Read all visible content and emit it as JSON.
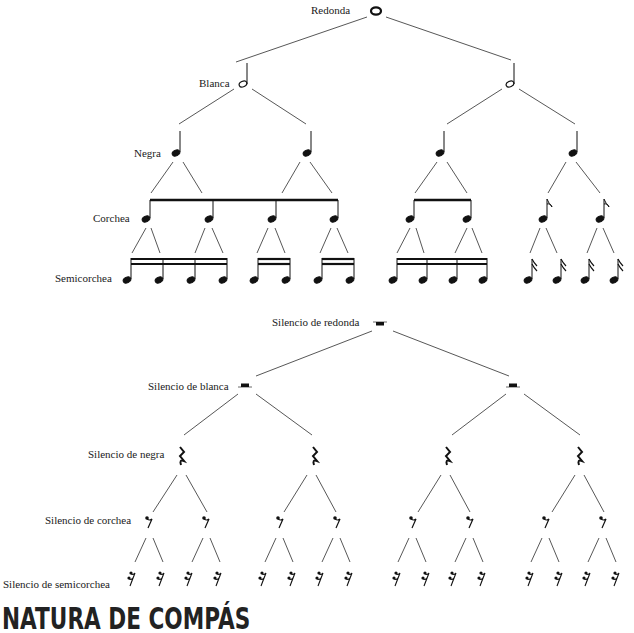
{
  "notes_tree": {
    "levels": [
      {
        "name": "Redonda",
        "count": 1,
        "symbol": "whole-note"
      },
      {
        "name": "Blanca",
        "count": 2,
        "symbol": "half-note"
      },
      {
        "name": "Negra",
        "count": 4,
        "symbol": "quarter-note"
      },
      {
        "name": "Corchea",
        "count": 8,
        "symbol": "eighth-note"
      },
      {
        "name": "Semicorchea",
        "count": 16,
        "symbol": "sixteenth-note"
      }
    ]
  },
  "rests_tree": {
    "levels": [
      {
        "name": "Silencio de redonda",
        "count": 1,
        "symbol": "whole-rest"
      },
      {
        "name": "Silencio de blanca",
        "count": 2,
        "symbol": "half-rest"
      },
      {
        "name": "Silencio de negra",
        "count": 4,
        "symbol": "quarter-rest"
      },
      {
        "name": "Silencio de corchea",
        "count": 8,
        "symbol": "eighth-rest"
      },
      {
        "name": "Silencio de semicorchea",
        "count": 16,
        "symbol": "sixteenth-rest"
      }
    ]
  },
  "heading": "NATURA DE COMPÁS"
}
